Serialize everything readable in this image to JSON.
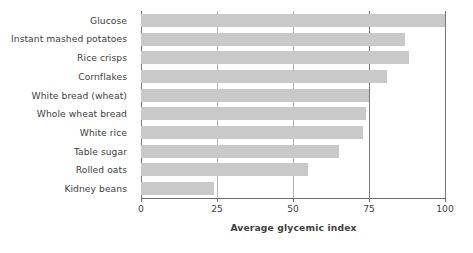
{
  "chart_data": {
    "type": "bar",
    "orientation": "horizontal",
    "title": "",
    "xlabel": "Average glycemic index",
    "ylabel": "",
    "xlim": [
      0,
      100
    ],
    "xticks": [
      0,
      25,
      50,
      75,
      100
    ],
    "grid": true,
    "legend": null,
    "categories": [
      "Glucose",
      "Instant mashed potatoes",
      "Rice crisps",
      "Cornflakes",
      "White bread (wheat)",
      "Whole wheat bread",
      "White rice",
      "Table sugar",
      "Rolled oats",
      "Kidney beans"
    ],
    "values": [
      100,
      87,
      88,
      81,
      75,
      74,
      73,
      65,
      55,
      24
    ],
    "bar_color": "#c9c9c9",
    "text_color": "#3f3f3f",
    "background_color": "#ffffff"
  }
}
